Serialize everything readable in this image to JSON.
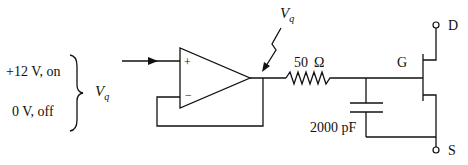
{
  "diagram": {
    "type": "circuit",
    "input_states": {
      "on": "+12 V, on",
      "off": "0 V, off"
    },
    "input_label": "V",
    "input_label_sub": "q",
    "opamp": {
      "plus": "+",
      "minus": "−"
    },
    "output_label": "V",
    "output_label_sub": "q",
    "resistor": {
      "label": "50",
      "unit": "Ω"
    },
    "capacitor": {
      "label": "2000 pF"
    },
    "transistor": {
      "gate": "G",
      "drain": "D",
      "source": "S"
    },
    "colors": {
      "stroke": "#111111",
      "background": "#ffffff"
    }
  }
}
